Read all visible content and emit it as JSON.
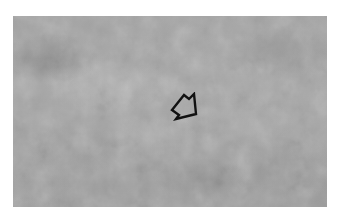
{
  "image": {
    "description": "Grayscale mottled cloud-like texture photograph with an outlined arrow annotation",
    "colors": {
      "background": "#ffffff",
      "image_base": "#9d9d9d",
      "arrow_stroke": "#111111"
    },
    "annotation": {
      "type": "arrow",
      "direction": "down-left",
      "style": "outlined"
    }
  }
}
